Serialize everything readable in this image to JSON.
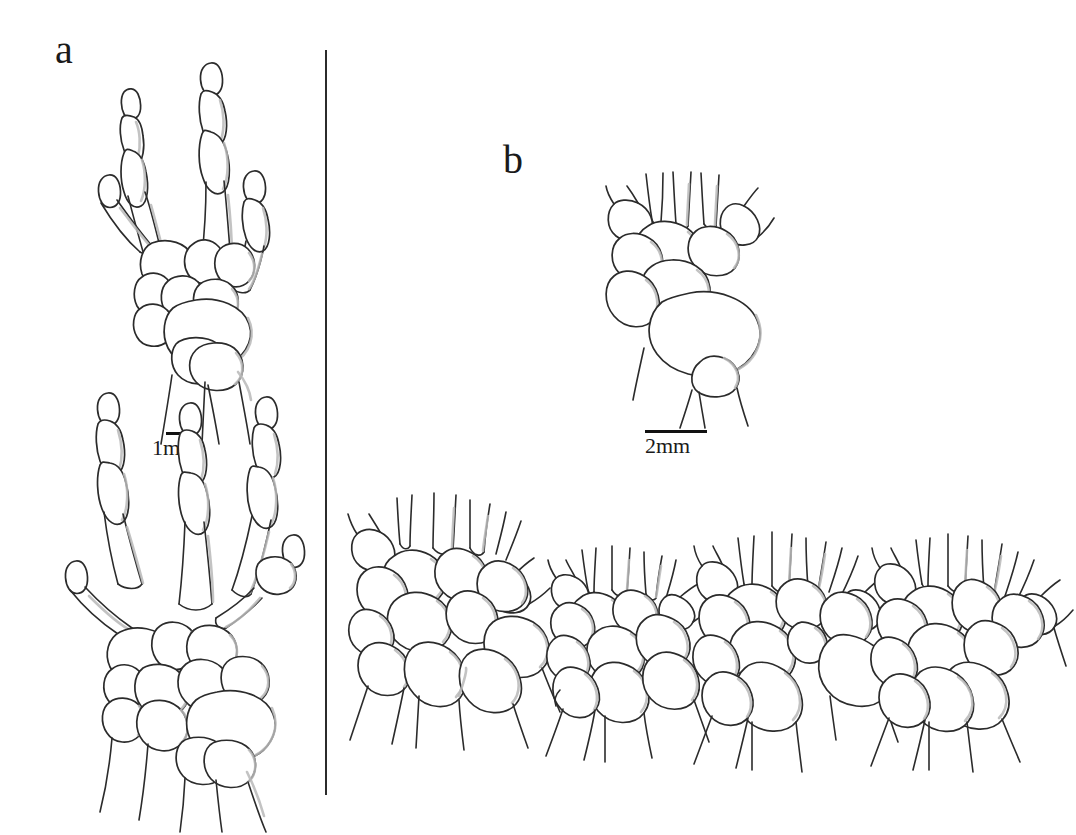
{
  "figure": {
    "type": "scientific-line-drawing",
    "background_color": "#ffffff",
    "ink_color": "#2b2b2b",
    "shading_color": "#b9b9b9"
  },
  "panels": [
    {
      "id": "a",
      "label": "a",
      "description": "Whole manus and pes skeletal drawings",
      "scalebar": {
        "label": "1mm",
        "value": 1,
        "unit": "mm"
      },
      "drawings": [
        {
          "name": "manus-upper",
          "digits": 4,
          "description": "hand skeleton with four digits, carpals and radius-ulna"
        },
        {
          "name": "pes-lower",
          "digits": 5,
          "description": "foot skeleton with five digits, tarsals and tibia-fibula"
        }
      ]
    },
    {
      "id": "b",
      "label": "b",
      "description": "Carpus close-up drawings",
      "scalebar": {
        "label": "2mm",
        "value": 2,
        "unit": "mm"
      },
      "drawings": [
        {
          "name": "carpus-top",
          "description": "enlarged carpus with metacarpal stubs"
        },
        {
          "name": "carpus-1",
          "description": "carpus variant 1"
        },
        {
          "name": "carpus-2",
          "description": "carpus variant 2"
        },
        {
          "name": "carpus-3",
          "description": "carpus variant 3"
        },
        {
          "name": "carpus-4",
          "description": "carpus variant 4"
        }
      ]
    }
  ],
  "divider": {
    "orientation": "vertical",
    "color": "#2b2b2b"
  }
}
